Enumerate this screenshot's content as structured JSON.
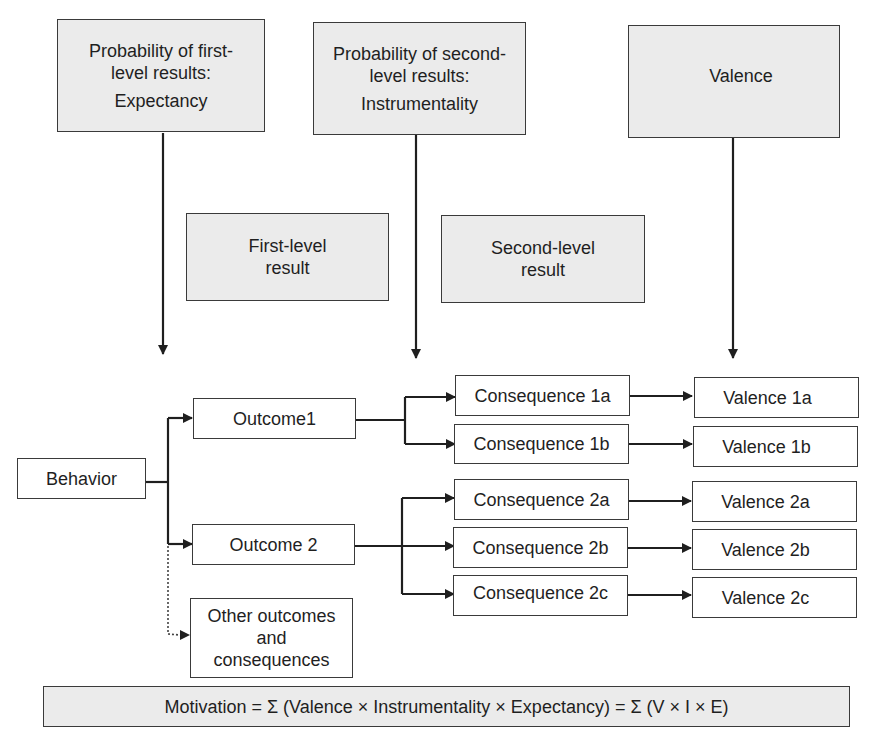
{
  "header_boxes": {
    "expectancy": {
      "line1": "Probability of first-",
      "line2": "level results:",
      "line3": "Expectancy"
    },
    "instrumentality": {
      "line1": "Probability of second-",
      "line2": "level results:",
      "line3": "Instrumentality"
    },
    "valence": {
      "label": "Valence"
    }
  },
  "result_labels": {
    "first_level": {
      "line1": "First-level",
      "line2": "result"
    },
    "second_level": {
      "line1": "Second-level",
      "line2": "result"
    }
  },
  "behavior": {
    "label": "Behavior"
  },
  "outcomes": [
    {
      "label": "Outcome1"
    },
    {
      "label": "Outcome 2"
    },
    {
      "line1": "Other outcomes",
      "line2": "and",
      "line3": "consequences"
    }
  ],
  "consequences": [
    {
      "label": "Consequence 1a"
    },
    {
      "label": "Consequence 1b"
    },
    {
      "label": "Consequence 2a"
    },
    {
      "label": "Consequence 2b"
    },
    {
      "label": "Consequence 2c"
    }
  ],
  "valences": [
    {
      "label": "Valence 1a"
    },
    {
      "label": "Valence 1b"
    },
    {
      "label": "Valence 2a"
    },
    {
      "label": "Valence 2b"
    },
    {
      "label": "Valence 2c"
    }
  ],
  "formula": {
    "text": "Motivation = Σ (Valence × Instrumentality × Expectancy) = Σ (V × I × E)"
  },
  "colors": {
    "box_fill_shaded": "#ebebeb",
    "stroke": "#1f1f1f"
  }
}
